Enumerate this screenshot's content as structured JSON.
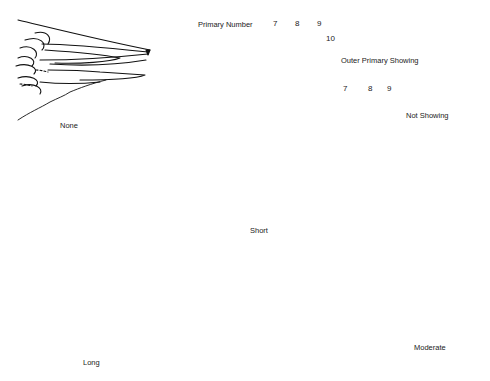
{
  "diagram": {
    "legend": {
      "primary_number_label": "Primary Number",
      "outer_showing": {
        "numbers": [
          "7",
          "8",
          "9",
          "10"
        ],
        "label": "Outer Primary Showing"
      },
      "not_showing": {
        "numbers": [
          "7",
          "8",
          "9"
        ],
        "label": "Not Showing"
      }
    },
    "wings": [
      {
        "id": "none",
        "label": "None"
      },
      {
        "id": "short",
        "label": "Short"
      },
      {
        "id": "long",
        "label": "Long"
      },
      {
        "id": "moderate",
        "label": "Moderate"
      }
    ],
    "colors": {
      "ink": "#111111",
      "background": "#ffffff"
    }
  }
}
